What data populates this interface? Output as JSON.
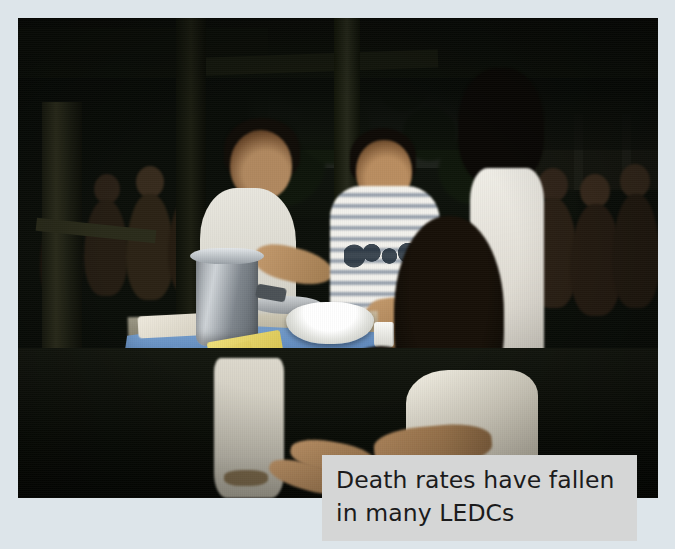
{
  "page": {
    "background_color": "#dde5ea",
    "type": "textbook-photo-figure"
  },
  "photo": {
    "alt_description": "Health workers at an outdoor clinic table with a blue tablecloth, a metal pot, an enamel bowl and papers; a woman in white holds a small child in the foreground while a crowd of villagers and children waits under a shelter.",
    "scene_elements": [
      "thatched-shelter-roof",
      "wooden-posts",
      "green-foliage",
      "distant-building-with-tan-roof",
      "health-worker-in-white-coat",
      "man-in-striped-t-shirt",
      "standing-person-in-white",
      "blue-tablecloth-table",
      "metal-cooking-pot",
      "white-enamel-bowl",
      "yellow-papers",
      "white-plastic-cup",
      "mother-holding-baby",
      "crowd-of-children"
    ],
    "dominant_colors": {
      "tablecloth_blue": "#5d87bb",
      "shadow_black": "#0a0d07",
      "foliage_green": "#3e6b22",
      "clothing_white": "#eae7de",
      "skin_tone": "#b98d60",
      "building_roof_tan": "#c9b48a"
    }
  },
  "caption": {
    "background_color": "#d5d6d6",
    "text_color": "#1b1b1c",
    "line1": "Death rates have fallen",
    "line2": "in many LEDCs",
    "full_text": "Death rates have fallen in many LEDCs"
  }
}
